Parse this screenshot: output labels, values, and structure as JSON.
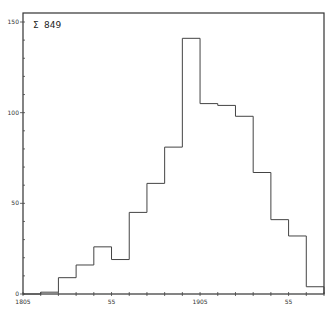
{
  "chart_data": {
    "type": "bar",
    "title_icon": "sigma-like-glyph",
    "xlabel": "",
    "ylabel": "",
    "bin_width": 10,
    "x_start": 1805,
    "bin_edges": [
      1805,
      1815,
      1825,
      1835,
      1845,
      1855,
      1865,
      1875,
      1885,
      1895,
      1905,
      1915,
      1925,
      1935,
      1945,
      1955,
      1965,
      1975
    ],
    "values": [
      0,
      1,
      9,
      16,
      26,
      19,
      45,
      61,
      81,
      141,
      105,
      104,
      98,
      67,
      41,
      32,
      4
    ],
    "x_tick_labels": [
      {
        "value": 1805,
        "label": "1805"
      },
      {
        "value": 1855,
        "label": "55"
      },
      {
        "value": 1905,
        "label": "1905"
      },
      {
        "value": 1955,
        "label": "55"
      }
    ],
    "y_tick_labels": [
      {
        "value": 0,
        "label": "0"
      },
      {
        "value": 50,
        "label": "50"
      },
      {
        "value": 100,
        "label": "100"
      },
      {
        "value": 150,
        "label": "150"
      }
    ],
    "ylim": [
      0,
      150
    ],
    "xlim": [
      1805,
      1975
    ],
    "grid": false,
    "style": "step-histogram"
  },
  "labels": {
    "title_symbol": "Σ",
    "title_text": "849"
  }
}
